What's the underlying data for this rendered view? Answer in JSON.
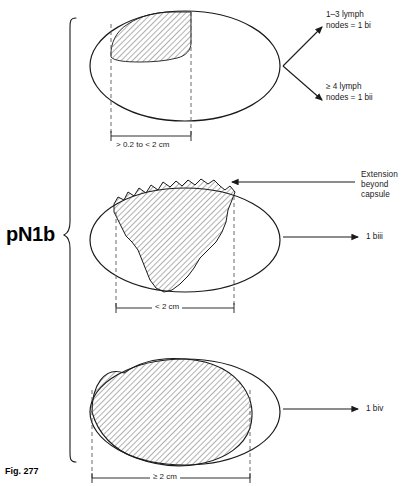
{
  "figure": {
    "caption": "Fig. 277",
    "stage_label": "pN1b"
  },
  "panels": [
    {
      "id": "panel-1bi-bii",
      "dimension_label": "> 0.2 to < 2 cm",
      "outcomes": [
        {
          "id": "outcome-1bi",
          "line1": "1–3 lymph",
          "line2": "nodes = 1 bi"
        },
        {
          "id": "outcome-1bii",
          "line1": "≥ 4 lymph",
          "line2": "nodes = 1 bii"
        }
      ]
    },
    {
      "id": "panel-1biii",
      "dimension_label": "< 2 cm",
      "annotation": {
        "line1": "Extension",
        "line2": "beyond",
        "line3": "capsule"
      },
      "outcomes": [
        {
          "id": "outcome-1biii",
          "line1": "1 biii"
        }
      ]
    },
    {
      "id": "panel-1biv",
      "dimension_label": "≥ 2 cm",
      "outcomes": [
        {
          "id": "outcome-1biv",
          "line1": "1 biv"
        }
      ]
    }
  ],
  "colors": {
    "stroke": "#1a1a1a",
    "hatch": "#3a3a3a",
    "background": "#ffffff"
  }
}
